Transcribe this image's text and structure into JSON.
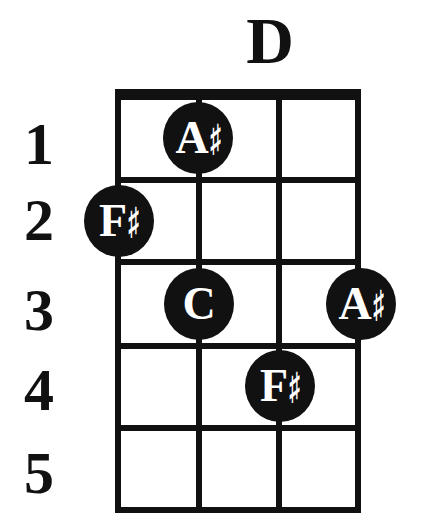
{
  "chord": {
    "name": "D",
    "fret_numbers": [
      "1",
      "2",
      "3",
      "4",
      "5"
    ],
    "strings": 4,
    "frets": 5,
    "notes": [
      {
        "letter": "A",
        "accidental": "♯",
        "fret": 1,
        "string": 2,
        "label": "A♯"
      },
      {
        "letter": "F",
        "accidental": "♯",
        "fret": 2,
        "string": 1,
        "label": "F♯"
      },
      {
        "letter": "C",
        "accidental": "",
        "fret": 3,
        "string": 2,
        "label": "C"
      },
      {
        "letter": "A",
        "accidental": "♯",
        "fret": 3,
        "string": 4,
        "label": "A♯"
      },
      {
        "letter": "F",
        "accidental": "♯",
        "fret": 4,
        "string": 3,
        "label": "F♯"
      }
    ]
  },
  "colors": {
    "ink": "#111111",
    "background": "#ffffff",
    "note_text": "#ffffff"
  }
}
